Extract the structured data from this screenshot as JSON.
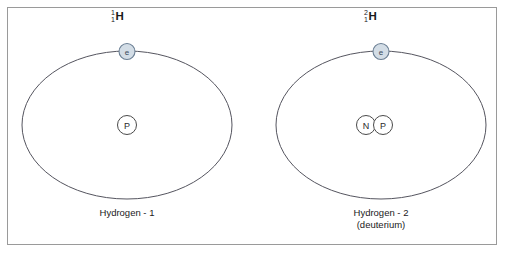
{
  "diagram": {
    "background_color": "#ffffff",
    "frame_color": "#9a9a9a",
    "orbit_color": "#55555f",
    "electron_fill": "#d3dde6",
    "electron_stroke": "#6b7f94",
    "nucleus_stroke": "#4a4a4a"
  },
  "atoms": [
    {
      "id": "hydrogen-1",
      "isotope_mass_number": "1",
      "isotope_atomic_number": "1",
      "isotope_symbol": "H",
      "caption_line1": "Hydrogen - 1",
      "caption_line2": "",
      "electron_label": "e",
      "nucleus_particles": [
        {
          "label": "P",
          "name": "proton"
        }
      ]
    },
    {
      "id": "hydrogen-2",
      "isotope_mass_number": "2",
      "isotope_atomic_number": "1",
      "isotope_symbol": "H",
      "caption_line1": "Hydrogen - 2",
      "caption_line2": "(deuterium)",
      "electron_label": "e",
      "nucleus_particles": [
        {
          "label": "N",
          "name": "neutron"
        },
        {
          "label": "P",
          "name": "proton"
        }
      ]
    }
  ]
}
